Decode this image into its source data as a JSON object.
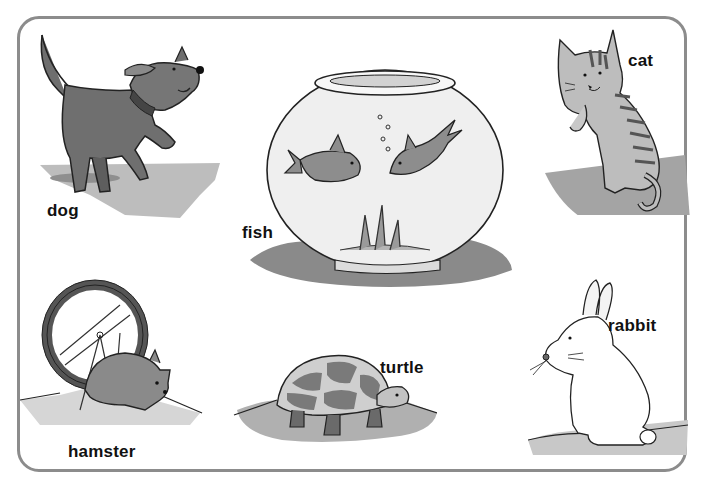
{
  "page": {
    "frame_color": "#8c8c8c",
    "ink_color": "#111111",
    "shadow_color": "#9a9a9a"
  },
  "animals": [
    {
      "id": "dog",
      "label": "dog",
      "icon": "dog-icon"
    },
    {
      "id": "fish",
      "label": "fish",
      "icon": "fishbowl-icon"
    },
    {
      "id": "cat",
      "label": "cat",
      "icon": "cat-icon"
    },
    {
      "id": "hamster",
      "label": "hamster",
      "icon": "hamster-icon"
    },
    {
      "id": "turtle",
      "label": "turtle",
      "icon": "turtle-icon"
    },
    {
      "id": "rabbit",
      "label": "rabbit",
      "icon": "rabbit-icon"
    }
  ]
}
